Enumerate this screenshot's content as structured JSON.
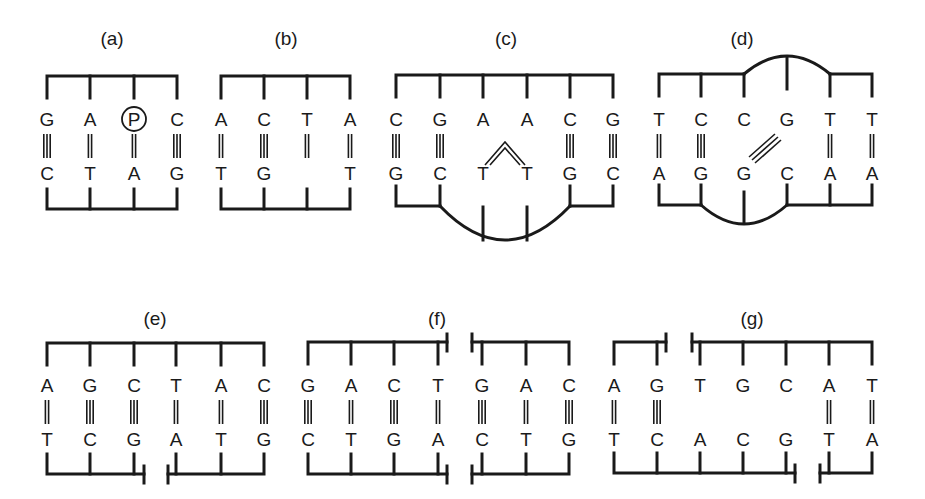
{
  "figure": {
    "ink": "#1a1a1a",
    "background": "#ffffff",
    "panels": [
      {
        "label": "(a)",
        "label_x": 112,
        "label_y": 45,
        "columns": [
          47,
          90,
          134,
          177
        ],
        "top_y": 76,
        "bottom_y": 209,
        "top_base_y": 126,
        "bottom_base_y": 180,
        "top_strand": [
          "G",
          "A",
          "P",
          "C"
        ],
        "bottom_strand": [
          "C",
          "T",
          "A",
          "G"
        ],
        "bonds": [
          3,
          2,
          2,
          3
        ],
        "annotation": "circled P modification on third base of top strand"
      },
      {
        "label": "(b)",
        "label_x": 286,
        "label_y": 45,
        "columns": [
          221,
          264,
          307,
          350
        ],
        "top_y": 76,
        "bottom_y": 209,
        "top_base_y": 126,
        "bottom_base_y": 180,
        "top_strand": [
          "A",
          "C",
          "T",
          "A"
        ],
        "bottom_strand": [
          "T",
          "G",
          "",
          "T"
        ],
        "bonds": [
          2,
          3,
          2,
          2
        ],
        "annotation": "missing base opposite T (abasic site)"
      },
      {
        "label": "(c)",
        "label_x": 506,
        "label_y": 45,
        "columns": [
          396,
          440,
          483,
          527,
          570,
          613
        ],
        "top_y": 75,
        "bottom_y": 206,
        "top_base_y": 126,
        "bottom_base_y": 180,
        "top_strand": [
          "C",
          "G",
          "A",
          "A",
          "C",
          "G"
        ],
        "bottom_strand": [
          "G",
          "C",
          "T",
          "T",
          "G",
          "C"
        ],
        "bonds": [
          3,
          3,
          0,
          0,
          3,
          3
        ],
        "annotation": "thymine dimer, bottom strand bulged"
      },
      {
        "label": "(d)",
        "label_x": 742,
        "label_y": 45,
        "columns": [
          659,
          701,
          744,
          787,
          830,
          872
        ],
        "top_y": 74,
        "bottom_y": 205,
        "top_base_y": 126,
        "bottom_base_y": 180,
        "top_strand": [
          "T",
          "C",
          "C",
          "G",
          "T",
          "T"
        ],
        "bottom_strand": [
          "A",
          "G",
          "G",
          "C",
          "A",
          "A"
        ],
        "bonds": [
          2,
          3,
          0,
          0,
          2,
          2
        ],
        "annotation": "interstrand cross-link between G and G"
      },
      {
        "label": "(e)",
        "label_x": 155,
        "label_y": 325,
        "columns": [
          47,
          90,
          134,
          176,
          221,
          264
        ],
        "top_y": 343,
        "bottom_y": 474,
        "top_base_y": 392,
        "bottom_base_y": 446,
        "top_strand": [
          "A",
          "G",
          "C",
          "T",
          "A",
          "C"
        ],
        "bottom_strand": [
          "T",
          "C",
          "G",
          "A",
          "T",
          "G"
        ],
        "bonds": [
          2,
          3,
          3,
          2,
          2,
          3
        ],
        "annotation": "single-strand nick in bottom strand"
      },
      {
        "label": "(f)",
        "label_x": 437,
        "label_y": 325,
        "columns": [
          308,
          351,
          394,
          438,
          482,
          526,
          569
        ],
        "top_y": 342,
        "bottom_y": 474,
        "top_base_y": 392,
        "bottom_base_y": 446,
        "top_strand": [
          "G",
          "A",
          "C",
          "T",
          "G",
          "A",
          "C"
        ],
        "bottom_strand": [
          "C",
          "T",
          "G",
          "A",
          "C",
          "T",
          "G"
        ],
        "bonds": [
          3,
          2,
          3,
          2,
          3,
          2,
          3
        ],
        "annotation": "double-strand break"
      },
      {
        "label": "(g)",
        "label_x": 752,
        "label_y": 325,
        "columns": [
          614,
          657,
          700,
          743,
          786,
          829,
          872
        ],
        "top_y": 342,
        "bottom_y": 473,
        "top_base_y": 392,
        "bottom_base_y": 446,
        "top_strand": [
          "A",
          "G",
          "T",
          "G",
          "C",
          "A",
          "T"
        ],
        "bottom_strand": [
          "T",
          "C",
          "A",
          "C",
          "G",
          "T",
          "A"
        ],
        "bonds": [
          2,
          3,
          0,
          0,
          0,
          2,
          2
        ],
        "annotation": "staggered gaps / unpaired mismatch region"
      }
    ]
  }
}
